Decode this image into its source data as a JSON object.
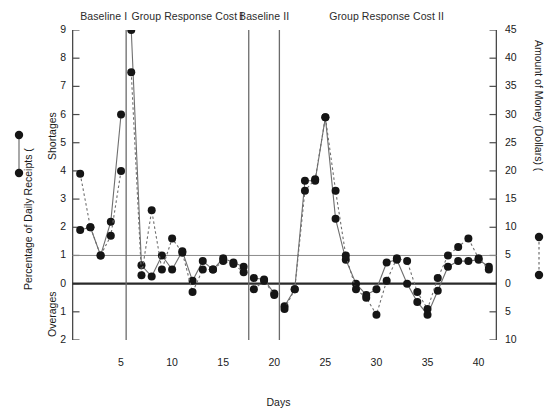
{
  "chart_data": {
    "type": "line",
    "title": "",
    "xlabel": "Days",
    "ylabel_left": "Percentage of Daily Receipts (",
    "ylabel_right": "Amount of Money (Dollars) (",
    "left_axis_upper_name": "Shortages",
    "left_axis_lower_name": "Overages",
    "x": [
      1,
      2,
      3,
      4,
      5,
      6,
      7,
      8,
      9,
      10,
      11,
      12,
      13,
      14,
      15,
      16,
      17,
      18,
      19,
      20,
      21,
      22,
      23,
      24,
      25,
      26,
      27,
      28,
      29,
      30,
      31,
      32,
      33,
      34,
      35,
      36,
      37,
      38,
      39,
      40,
      41
    ],
    "xlim": [
      0.2,
      41.8
    ],
    "xticks": [
      5,
      10,
      15,
      20,
      25,
      30,
      35,
      40
    ],
    "left_ylim": [
      -2,
      9
    ],
    "left_yticks": [
      9,
      8,
      7,
      6,
      5,
      4,
      3,
      2,
      1,
      0,
      1,
      2
    ],
    "left_ytick_values": [
      9,
      8,
      7,
      6,
      5,
      4,
      3,
      2,
      1,
      0,
      -1,
      -2
    ],
    "right_ylim": [
      -10,
      45
    ],
    "right_yticks": [
      45,
      40,
      35,
      30,
      25,
      20,
      15,
      10,
      5,
      0,
      5,
      10
    ],
    "right_ytick_values": [
      45,
      40,
      35,
      30,
      25,
      20,
      15,
      10,
      5,
      0,
      -5,
      -10
    ],
    "grid": false,
    "reference_lines": [
      {
        "value": 1,
        "style": "thin",
        "axis": "left"
      },
      {
        "value": 0,
        "style": "thick",
        "axis": "left"
      }
    ],
    "phase_lines_x": [
      5.5,
      17.5,
      20.5
    ],
    "phases": [
      {
        "label": "Baseline I",
        "x_center": 3.3
      },
      {
        "label": "Group Response Cost I",
        "x_center": 11.5
      },
      {
        "label": "Baseline II",
        "x_center": 19.0
      },
      {
        "label": "Group Response Cost II",
        "x_center": 31.0
      }
    ],
    "series": [
      {
        "name": "Percentage of Daily Receipts",
        "line": "solid",
        "marker": "circle",
        "axis": "left",
        "values": [
          1.9,
          2.0,
          1.0,
          2.2,
          6.0,
          9.0,
          0.65,
          0.25,
          1.0,
          0.5,
          1.15,
          0.1,
          0.8,
          0.5,
          0.9,
          0.75,
          0.6,
          0.2,
          0.15,
          -0.35,
          -0.8,
          -0.2,
          3.65,
          3.65,
          5.9,
          2.3,
          0.85,
          0.0,
          -0.4,
          -0.2,
          0.75,
          0.85,
          0.0,
          -0.65,
          -1.1,
          -0.25,
          0.6,
          0.8,
          0.8,
          0.85,
          0.6
        ]
      },
      {
        "name": "Amount of Money (Dollars)",
        "line": "dashed",
        "marker": "circle",
        "axis": "right",
        "values": [
          19.5,
          10.0,
          5.0,
          8.5,
          20.0,
          37.5,
          1.5,
          13.0,
          2.5,
          8.0,
          5.5,
          -1.5,
          2.5,
          2.5,
          4.0,
          3.5,
          2.0,
          -1.0,
          0.5,
          -2.0,
          -4.5,
          -1.0,
          16.5,
          18.5,
          29.5,
          16.5,
          5.0,
          -1.0,
          -2.5,
          -5.5,
          0.5,
          4.5,
          4.0,
          -1.5,
          -4.5,
          1.0,
          5.0,
          6.5,
          8.0,
          4.5,
          2.5
        ]
      }
    ]
  },
  "legend": {
    "left": {
      "name": "solid-line-legend-symbol",
      "line": "solid"
    },
    "right": {
      "name": "dashed-line-legend-symbol",
      "line": "dashed"
    }
  },
  "colors": {
    "marker": "#151515",
    "line": "#6f6f6f",
    "axis": "#4a4a4a",
    "reference_thick": "#2a2a2a",
    "reference_thin": "#8c8c8c",
    "phase_line": "#6b6b6b",
    "text": "#1a1a1a"
  }
}
